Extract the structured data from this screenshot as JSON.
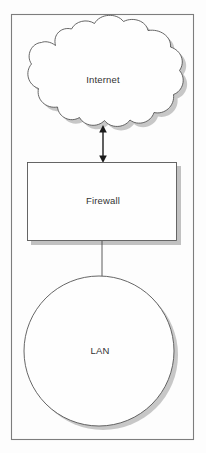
{
  "diagram": {
    "canvas": {
      "width": 206,
      "height": 453,
      "background": "#fdfdfd"
    },
    "frame": {
      "name": "diagram-border",
      "x": 11,
      "y": 14,
      "width": 183,
      "height": 426,
      "stroke": "#7d7d7d"
    },
    "nodes": [
      {
        "id": "internet",
        "shape": "cloud",
        "label": "Internet",
        "label_x": 103,
        "label_y": 80,
        "bounds": {
          "x": 18,
          "y": 25,
          "width": 174,
          "height": 112
        },
        "fill": "#fefefe",
        "stroke": "#555555"
      },
      {
        "id": "firewall",
        "shape": "rectangle",
        "label": "Firewall",
        "label_x": 103,
        "label_y": 201,
        "bounds": {
          "x": 27,
          "y": 162,
          "width": 150,
          "height": 79
        },
        "fill": "#fefefe",
        "stroke": "#555555"
      },
      {
        "id": "lan",
        "shape": "circle",
        "label": "LAN",
        "label_x": 100,
        "label_y": 351,
        "bounds": {
          "x": 24,
          "y": 276,
          "width": 150,
          "height": 150
        },
        "center_x": 99,
        "center_y": 351,
        "radius": 75,
        "fill": "#fefefe",
        "stroke": "#555555"
      }
    ],
    "connectors": [
      {
        "id": "internet-to-firewall",
        "from": "internet",
        "to": "firewall",
        "style": "double-arrow",
        "x": 103,
        "y1": 126,
        "y2": 162,
        "color": "#1a1a1a"
      },
      {
        "id": "firewall-to-lan",
        "from": "firewall",
        "to": "lan",
        "style": "plain-line",
        "x": 102,
        "y1": 241,
        "y2": 278,
        "color": "#4a4a4a"
      }
    ],
    "colors": {
      "shape_fill": "#fefefe",
      "shape_stroke": "#555555",
      "shadow": "#9a9a9a",
      "frame_stroke": "#7d7d7d",
      "text": "#333333",
      "arrow": "#1a1a1a"
    }
  }
}
